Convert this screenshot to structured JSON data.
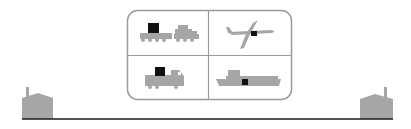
{
  "diagram": {
    "title": "",
    "colors": {
      "background": "#ffffff",
      "shape_fill": "#a6a6a6",
      "cargo": "#111111",
      "frame_stroke": "#9a9a9a",
      "ground_line": "#1a1a1a"
    },
    "nodes": [
      {
        "id": "origin",
        "icon": "factory-icon",
        "position": "left"
      },
      {
        "id": "destination",
        "icon": "factory-icon",
        "position": "right"
      }
    ],
    "transport_modes": [
      {
        "id": "rail",
        "icon": "train-icon",
        "cell": "top-left"
      },
      {
        "id": "air",
        "icon": "airplane-icon",
        "cell": "top-right"
      },
      {
        "id": "road",
        "icon": "truck-icon",
        "cell": "bottom-left"
      },
      {
        "id": "sea",
        "icon": "ship-icon",
        "cell": "bottom-right"
      }
    ],
    "connection": {
      "type": "ground-line",
      "from": "origin",
      "to": "destination"
    }
  }
}
